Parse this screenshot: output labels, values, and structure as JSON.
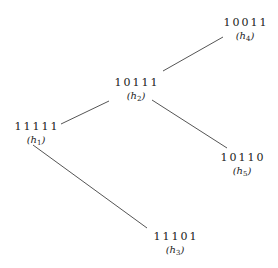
{
  "diagram": {
    "type": "tree",
    "nodes": [
      {
        "id": "h1",
        "code": "11111",
        "label_var": "h",
        "label_sub": "1",
        "x": 36,
        "y": 121
      },
      {
        "id": "h2",
        "code": "10111",
        "label_var": "h",
        "label_sub": "2",
        "x": 136,
        "y": 77
      },
      {
        "id": "h3",
        "code": "11101",
        "label_var": "h",
        "label_sub": "3",
        "x": 175,
        "y": 231
      },
      {
        "id": "h4",
        "code": "10011",
        "label_var": "h",
        "label_sub": "4",
        "x": 245,
        "y": 17
      },
      {
        "id": "h5",
        "code": "10110",
        "label_var": "h",
        "label_sub": "5",
        "x": 242,
        "y": 152
      }
    ],
    "edges": [
      {
        "from": "h1",
        "to": "h2"
      },
      {
        "from": "h2",
        "to": "h4"
      },
      {
        "from": "h2",
        "to": "h5"
      },
      {
        "from": "h1",
        "to": "h3"
      }
    ],
    "colors": {
      "edge": "#555555",
      "text": "#222222",
      "background": "#ffffff"
    }
  }
}
